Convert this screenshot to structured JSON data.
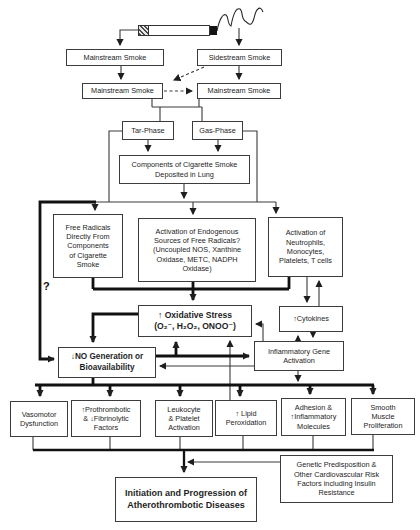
{
  "colors": {
    "ink": "#1e1e1e",
    "background": "#ffffff"
  },
  "annotations": {
    "question_mark": "?"
  },
  "nodes": {
    "mainstream_1": {
      "label": "Mainstream Smoke"
    },
    "sidestream": {
      "label": "Sidestream Smoke"
    },
    "mainstream_2": {
      "label": "Mainstream Smoke"
    },
    "mainstream_3": {
      "label": "Mainstream Smoke"
    },
    "tar_phase": {
      "label": "Tar-Phase"
    },
    "gas_phase": {
      "label": "Gas-Phase"
    },
    "components": {
      "label": "Components of Cigarette Smoke\nDeposited in Lung"
    },
    "free_radicals": {
      "label": "Free Radicals\nDirectly From\nComponents\nof Cigarette\nSmoke"
    },
    "endogenous": {
      "label": "Activation of Endogenous\nSources of Free Radicals?\n(Uncoupled NOS, Xanthine\nOxidase, METC, NADPH\nOxidase)"
    },
    "neutrophils": {
      "label": "Activation of\nNeutrophils,\nMonocytes,\nPlatelets, T cells"
    },
    "oxidative": {
      "label": "↑ Oxidative Stress\n(O₂⁻, H₂O₂, ONOO⁻)"
    },
    "cytokines": {
      "label": "↑Cytokines"
    },
    "inflammatory": {
      "label": "Inflammatory Gene\nActivation"
    },
    "no_generation": {
      "label": "↓NO Generation or\nBioavailability"
    },
    "vasomotor": {
      "label": "Vasomotor\nDysfunction"
    },
    "prothrombotic": {
      "label": "↑Prothrombotic\n& ↓Fibrinolytic\nFactors"
    },
    "leukocyte": {
      "label": "Leukocyte\n& Platelet\nActivation"
    },
    "lipid": {
      "label": "↑ Lipid\nPeroxidation"
    },
    "adhesion": {
      "label": "Adhesion &\n↑Inflammatory\nMolecules"
    },
    "smooth_muscle": {
      "label": "Smooth\nMuscle\nProliferation"
    },
    "genetic": {
      "label": "Genetic Predisposition &\nOther Cardiovascular Risk\nFactors including Insulin\nResistance"
    },
    "initiation": {
      "label": "Initiation and Progression of\nAtherothrombotic Diseases"
    }
  }
}
